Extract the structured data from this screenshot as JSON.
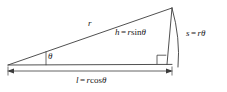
{
  "figure": {
    "name": "right-triangle-trigonometry",
    "background_color": "#ffffff",
    "stroke_color": "#3c3c3c",
    "text_color": "#1a1a1a"
  },
  "labels": {
    "radius": {
      "id": "r",
      "text": "r",
      "description": "hypotenuse length label"
    },
    "angle": {
      "id": "theta",
      "text": "θ",
      "description": "angle at left vertex"
    },
    "height": {
      "var": "h",
      "equals": "=",
      "coefficient": "r",
      "function": "sin",
      "argument": "θ",
      "full_text": "h = r sin θ"
    },
    "arc": {
      "var": "s",
      "equals": "=",
      "coefficient": "r",
      "argument": "θ",
      "full_text": "s = rθ"
    },
    "base": {
      "var": "l",
      "equals": "=",
      "coefficient": "r",
      "function": "cos",
      "argument": "θ",
      "full_text": "l = r cos θ"
    }
  },
  "geometry": {
    "apex": {
      "x": 172,
      "y": 8
    },
    "left_vertex": {
      "x": 8,
      "y": 65
    },
    "foot": {
      "x": 167,
      "y": 64
    },
    "arc_end": {
      "x": 178,
      "y": 67
    },
    "dimension_line_y": 71,
    "right_angle_marker": {
      "x": 157,
      "y": 54,
      "size": 9
    }
  }
}
